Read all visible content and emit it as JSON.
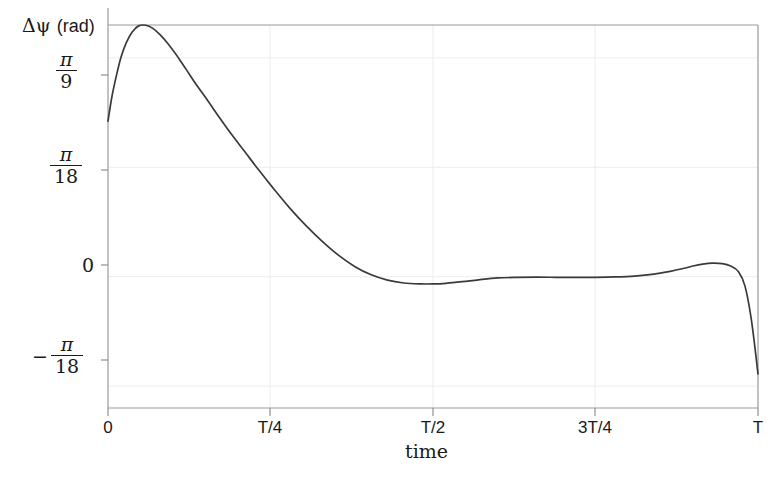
{
  "chart_data": {
    "type": "line",
    "title": "",
    "xlabel": "time",
    "ylabel": "Δψ (rad)",
    "ylabel_symbol": "Δψ",
    "ylabel_unit": "(rad)",
    "grid": true,
    "legend": false,
    "line_color": "#3a3a3a",
    "grid_color": "#e8e8e8",
    "axis_color": "#8f8f8f",
    "xlim": [
      0,
      1
    ],
    "ylim": [
      -0.2094,
      0.4014
    ],
    "xticks": [
      {
        "value": 0,
        "label": "0"
      },
      {
        "value": 0.25,
        "label": "T/4"
      },
      {
        "value": 0.5,
        "label": "T/2"
      },
      {
        "value": 0.75,
        "label": "3T/4"
      },
      {
        "value": 1,
        "label": "T"
      }
    ],
    "yticks": [
      {
        "value": 0.3491,
        "label": "π/9",
        "numerator": "π",
        "denominator": "9",
        "negative": false
      },
      {
        "value": 0.1745,
        "label": "π/18",
        "numerator": "π",
        "denominator": "18",
        "negative": false
      },
      {
        "value": 0,
        "label": "0",
        "numerator": "",
        "denominator": "",
        "negative": false
      },
      {
        "value": -0.1745,
        "label": "-π/18",
        "numerator": "π",
        "denominator": "18",
        "negative": true
      }
    ],
    "series": [
      {
        "name": "delta-psi",
        "x": [
          0.0,
          0.006,
          0.013,
          0.02,
          0.028,
          0.037,
          0.047,
          0.058,
          0.069,
          0.08,
          0.092,
          0.105,
          0.12,
          0.136,
          0.152,
          0.17,
          0.19,
          0.21,
          0.232,
          0.255,
          0.28,
          0.305,
          0.33,
          0.355,
          0.38,
          0.405,
          0.43,
          0.455,
          0.48,
          0.5,
          0.52,
          0.545,
          0.57,
          0.6,
          0.63,
          0.66,
          0.69,
          0.72,
          0.75,
          0.78,
          0.81,
          0.84,
          0.865,
          0.885,
          0.9,
          0.915,
          0.93,
          0.945,
          0.958,
          0.97,
          0.98,
          0.99,
          1.0
        ],
        "y": [
          0.248,
          0.287,
          0.321,
          0.35,
          0.373,
          0.39,
          0.4,
          0.401,
          0.396,
          0.386,
          0.372,
          0.354,
          0.331,
          0.306,
          0.283,
          0.256,
          0.227,
          0.2,
          0.17,
          0.14,
          0.109,
          0.081,
          0.056,
          0.034,
          0.016,
          0.003,
          -0.0055,
          -0.01,
          -0.0115,
          -0.0115,
          -0.0105,
          -0.008,
          -0.005,
          -0.002,
          -0.001,
          -0.0008,
          -0.001,
          -0.0012,
          -0.001,
          -0.0004,
          0.001,
          0.004,
          0.0085,
          0.013,
          0.017,
          0.02,
          0.0215,
          0.0208,
          0.017,
          0.008,
          -0.015,
          -0.07,
          -0.155
        ]
      }
    ],
    "annotations": []
  }
}
